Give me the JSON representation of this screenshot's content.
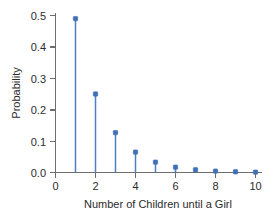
{
  "chart_data": {
    "type": "scatter",
    "plot_style": "stem",
    "title": "",
    "xlabel": "Number of Children until a Girl",
    "ylabel": "Probability",
    "x": [
      1,
      2,
      3,
      4,
      5,
      6,
      7,
      8,
      9,
      10
    ],
    "values": [
      0.49,
      0.25,
      0.127,
      0.065,
      0.033,
      0.017,
      0.0086,
      0.0044,
      0.0022,
      0.0011
    ],
    "series": [
      {
        "name": "Probability",
        "values": [
          0.49,
          0.25,
          0.127,
          0.065,
          0.033,
          0.017,
          0.0086,
          0.0044,
          0.0022,
          0.0011
        ]
      }
    ],
    "xlim": [
      -0.35,
      10.85
    ],
    "ylim": [
      0.0,
      0.52
    ],
    "xticks": [
      0,
      2,
      4,
      6,
      8,
      10
    ],
    "xtick_labels": [
      "0",
      "2",
      "4",
      "6",
      "8",
      "10"
    ],
    "xticks_minor": [
      1,
      3,
      5,
      7,
      9
    ],
    "yticks": [
      0.0,
      0.1,
      0.2,
      0.3,
      0.4,
      0.5
    ],
    "ytick_labels": [
      "0.0",
      "0.1",
      "0.2",
      "0.3",
      "0.4",
      "0.5"
    ],
    "grid": false,
    "legend": "none",
    "annotations": [],
    "colors": {
      "marker": "#3f6fb5",
      "stem": "#4f7fc0",
      "axis": "#6e6e6e",
      "text": "#2b2b2b",
      "background": "#ffffff"
    }
  }
}
